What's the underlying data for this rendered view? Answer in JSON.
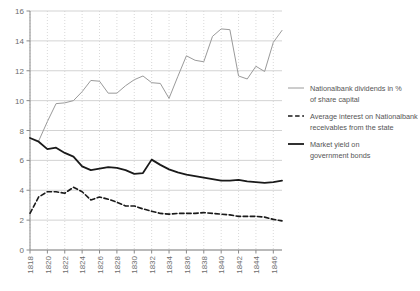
{
  "chart_data": {
    "type": "line",
    "title": "",
    "xlabel": "",
    "ylabel": "",
    "xlim": [
      1818,
      1847
    ],
    "ylim": [
      0,
      16
    ],
    "ytick_values": [
      0,
      2,
      4,
      6,
      8,
      10,
      12,
      14,
      16
    ],
    "ytick_labels": [
      "0",
      "2",
      "4",
      "6",
      "8",
      "10",
      "12",
      "14",
      "16"
    ],
    "xtick_values": [
      1818,
      1820,
      1822,
      1824,
      1826,
      1828,
      1830,
      1832,
      1834,
      1836,
      1838,
      1840,
      1842,
      1844,
      1846
    ],
    "xtick_labels": [
      "1818",
      "1820",
      "1822",
      "1824",
      "1826",
      "1828",
      "1830",
      "1832",
      "1834",
      "1836",
      "1838",
      "1840",
      "1842",
      "1844",
      "1846"
    ],
    "grid": "horizontal solid, vertical dotted",
    "legend_position": "right",
    "x": [
      1818,
      1819,
      1820,
      1821,
      1822,
      1823,
      1824,
      1825,
      1826,
      1827,
      1828,
      1829,
      1830,
      1831,
      1832,
      1833,
      1834,
      1835,
      1836,
      1837,
      1838,
      1839,
      1840,
      1841,
      1842,
      1843,
      1844,
      1845,
      1846,
      1847
    ],
    "series": [
      {
        "name": "Nationalbank dividends in % of share capital",
        "key": "dividends",
        "color": "#9a9a9a",
        "style": "solid",
        "width": 1,
        "x": [
          1819,
          1820,
          1821,
          1822,
          1823,
          1824,
          1825,
          1826,
          1827,
          1828,
          1829,
          1830,
          1831,
          1832,
          1833,
          1834,
          1835,
          1836,
          1837,
          1838,
          1839,
          1840,
          1841,
          1842,
          1843,
          1844,
          1845,
          1846,
          1847
        ],
        "values": [
          7.3,
          8.6,
          9.8,
          9.85,
          10.0,
          10.6,
          11.35,
          11.3,
          10.5,
          10.5,
          11.0,
          11.4,
          11.65,
          11.2,
          11.15,
          10.15,
          11.6,
          13.0,
          12.7,
          12.6,
          14.3,
          14.8,
          14.75,
          11.65,
          11.45,
          12.3,
          11.95,
          13.9,
          14.7
        ]
      },
      {
        "name": "Average interest on Nationalbank receivables from the state",
        "key": "interest",
        "color": "#1a1a1a",
        "style": "dashed",
        "width": 1.6,
        "x": [
          1818,
          1819,
          1820,
          1821,
          1822,
          1823,
          1824,
          1825,
          1826,
          1827,
          1828,
          1829,
          1830,
          1831,
          1832,
          1833,
          1834,
          1835,
          1836,
          1837,
          1838,
          1839,
          1840,
          1841,
          1842,
          1843,
          1844,
          1845,
          1846,
          1847
        ],
        "values": [
          2.45,
          3.55,
          3.9,
          3.9,
          3.8,
          4.2,
          3.9,
          3.35,
          3.55,
          3.4,
          3.2,
          2.95,
          2.95,
          2.75,
          2.6,
          2.45,
          2.4,
          2.45,
          2.45,
          2.45,
          2.5,
          2.45,
          2.4,
          2.35,
          2.25,
          2.25,
          2.25,
          2.2,
          2.05,
          1.95
        ]
      },
      {
        "name": "Market yield on government bonds",
        "key": "market_yield",
        "color": "#1a1a1a",
        "style": "solid",
        "width": 1.8,
        "x": [
          1818,
          1819,
          1820,
          1821,
          1822,
          1823,
          1824,
          1825,
          1826,
          1827,
          1828,
          1829,
          1830,
          1831,
          1832,
          1833,
          1834,
          1835,
          1836,
          1837,
          1838,
          1839,
          1840,
          1841,
          1842,
          1843,
          1844,
          1845,
          1846,
          1847
        ],
        "values": [
          7.5,
          7.25,
          6.75,
          6.85,
          6.5,
          6.25,
          5.6,
          5.35,
          5.45,
          5.55,
          5.5,
          5.35,
          5.1,
          5.15,
          6.05,
          5.7,
          5.4,
          5.2,
          5.05,
          4.95,
          4.85,
          4.75,
          4.65,
          4.65,
          4.7,
          4.6,
          4.55,
          4.5,
          4.55,
          4.65
        ]
      }
    ]
  },
  "legend": {
    "items": [
      {
        "label_line1": "Nationalbank dividends in %",
        "label_line2": "of share capital",
        "swatch": "line-grey-solid"
      },
      {
        "label_line1": "Average interest on Nationalbank",
        "label_line2": "receivables from the state",
        "swatch": "line-black-dashed"
      },
      {
        "label_line1": "Market yield on",
        "label_line2": "government bonds",
        "swatch": "line-black-solid"
      }
    ]
  },
  "colors": {
    "grid_horizontal": "#c8c8c8",
    "grid_vertical": "#cfcfcf",
    "axis": "#8a8a8a",
    "tick_text": "#6d6d6d",
    "legend_text": "#555555",
    "background": "#ffffff"
  }
}
